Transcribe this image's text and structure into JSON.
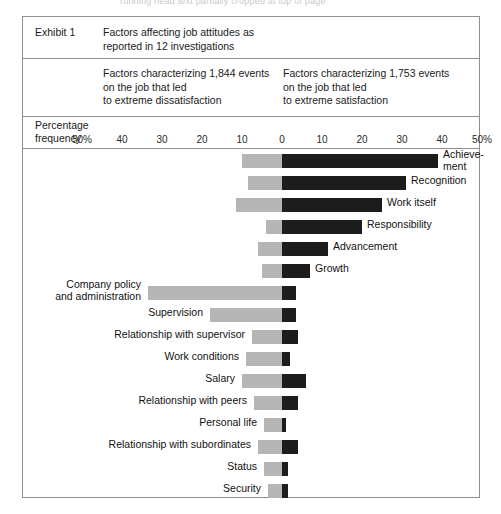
{
  "page_artifact": "running head text partially cropped at top of page",
  "exhibit": {
    "label": "Exhibit 1",
    "title": "Factors affecting job attitudes as\nreported in 12 investigations",
    "left_caption": "Factors characterizing 1,844 events\non the job that led\nto extreme dissatisfaction",
    "right_caption": "Factors characterizing 1,753 events\non the job that led\nto extreme satisfaction"
  },
  "axis": {
    "title": "Percentage\nfrequency",
    "ticks": [
      "50%",
      "40",
      "30",
      "20",
      "10",
      "0",
      "10",
      "20",
      "30",
      "40",
      "50%"
    ]
  },
  "colors": {
    "dissatisfaction": "#b5b5b5",
    "satisfaction": "#1c1c1c",
    "border": "#8a8f96",
    "text": "#1a1a1a"
  },
  "chart_data": {
    "type": "bar",
    "orientation": "horizontal-diverging",
    "title": "Factors affecting job attitudes as reported in 12 investigations",
    "xlabel": "Percentage frequency",
    "ylabel": "",
    "xlim": [
      -50,
      50
    ],
    "grid": false,
    "legend_position": "top",
    "series": [
      {
        "name": "Factors characterizing 1,844 events on the job that led to extreme dissatisfaction",
        "color": "#b5b5b5",
        "direction": "left"
      },
      {
        "name": "Factors characterizing 1,753 events on the job that led to extreme satisfaction",
        "color": "#1c1c1c",
        "direction": "right"
      }
    ],
    "categories": [
      "Achieve-\nment",
      "Recognition",
      "Work itself",
      "Responsibility",
      "Advancement",
      "Growth",
      "Company policy\nand administration",
      "Supervision",
      "Relationship with supervisor",
      "Work conditions",
      "Salary",
      "Relationship with peers",
      "Personal life",
      "Relationship with subordinates",
      "Status",
      "Security"
    ],
    "rows": [
      {
        "label": "Achieve-\nment",
        "dissatisfaction": 10,
        "satisfaction": 39,
        "label_side": "right",
        "label_lines": 2
      },
      {
        "label": "Recognition",
        "dissatisfaction": 8.5,
        "satisfaction": 31,
        "label_side": "right",
        "label_lines": 1
      },
      {
        "label": "Work itself",
        "dissatisfaction": 11.5,
        "satisfaction": 25,
        "label_side": "right",
        "label_lines": 1
      },
      {
        "label": "Responsibility",
        "dissatisfaction": 4,
        "satisfaction": 20,
        "label_side": "right",
        "label_lines": 1
      },
      {
        "label": "Advancement",
        "dissatisfaction": 6,
        "satisfaction": 11.5,
        "label_side": "right",
        "label_lines": 1
      },
      {
        "label": "Growth",
        "dissatisfaction": 5,
        "satisfaction": 7,
        "label_side": "right",
        "label_lines": 1
      },
      {
        "label": "Company policy\nand administration",
        "dissatisfaction": 33.5,
        "satisfaction": 3.5,
        "label_side": "left",
        "label_lines": 2
      },
      {
        "label": "Supervision",
        "dissatisfaction": 18,
        "satisfaction": 3.5,
        "label_side": "left",
        "label_lines": 1
      },
      {
        "label": "Relationship with supervisor",
        "dissatisfaction": 7.5,
        "satisfaction": 4,
        "label_side": "left",
        "label_lines": 1
      },
      {
        "label": "Work conditions",
        "dissatisfaction": 9,
        "satisfaction": 2,
        "label_side": "left",
        "label_lines": 1
      },
      {
        "label": "Salary",
        "dissatisfaction": 10,
        "satisfaction": 6,
        "label_side": "left",
        "label_lines": 1
      },
      {
        "label": "Relationship with peers",
        "dissatisfaction": 7,
        "satisfaction": 4,
        "label_side": "left",
        "label_lines": 1
      },
      {
        "label": "Personal life",
        "dissatisfaction": 4.5,
        "satisfaction": 1,
        "label_side": "left",
        "label_lines": 1
      },
      {
        "label": "Relationship with subordinates",
        "dissatisfaction": 6,
        "satisfaction": 4,
        "label_side": "left",
        "label_lines": 1
      },
      {
        "label": "Status",
        "dissatisfaction": 4.5,
        "satisfaction": 1.5,
        "label_side": "left",
        "label_lines": 1
      },
      {
        "label": "Security",
        "dissatisfaction": 3.5,
        "satisfaction": 1.5,
        "label_side": "left",
        "label_lines": 1
      }
    ]
  }
}
